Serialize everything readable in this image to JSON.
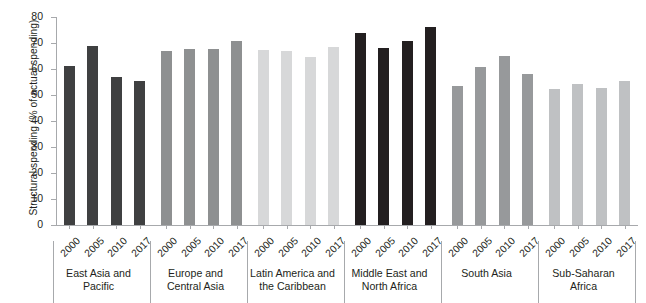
{
  "chart_data": {
    "type": "bar",
    "title": "",
    "xlabel": "",
    "ylabel": "Structural spending (% of actual spending)",
    "ylim": [
      0,
      80
    ],
    "ytick_labels": [
      "80",
      "70",
      "60",
      "50",
      "40",
      "30",
      "20",
      "10",
      "0"
    ],
    "ytick_values": [
      80,
      70,
      60,
      50,
      40,
      30,
      20,
      10,
      0
    ],
    "grid": false,
    "legend": "none",
    "categories": [
      "2000",
      "2005",
      "2010",
      "2017"
    ],
    "groups": [
      {
        "name": "East Asia and Pacific",
        "label_lines": [
          "East Asia and",
          "Pacific"
        ],
        "color": "#3f4041",
        "years": [
          "2000",
          "2005",
          "2010",
          "2017"
        ],
        "values": [
          61.0,
          69.0,
          56.9,
          55.3
        ]
      },
      {
        "name": "Europe and Central Asia",
        "label_lines": [
          "Europe and",
          "Central Asia"
        ],
        "color": "#8e9091",
        "years": [
          "2000",
          "2005",
          "2010",
          "2017"
        ],
        "values": [
          67.1,
          67.7,
          67.8,
          70.8
        ]
      },
      {
        "name": "Latin America and the Caribbean",
        "label_lines": [
          "Latin America and",
          "the Caribbean"
        ],
        "color": "#d7d8d9",
        "years": [
          "2000",
          "2005",
          "2010",
          "2017"
        ],
        "values": [
          67.4,
          66.9,
          64.5,
          68.3
        ]
      },
      {
        "name": "Middle East and North Africa",
        "label_lines": [
          "Middle East and",
          "North Africa"
        ],
        "color": "#231f20",
        "years": [
          "2000",
          "2005",
          "2010",
          "2017"
        ],
        "values": [
          74.0,
          68.1,
          70.6,
          76.2
        ]
      },
      {
        "name": "South Asia",
        "label_lines": [
          "South Asia"
        ],
        "color": "#97999b",
        "years": [
          "2000",
          "2005",
          "2010",
          "2017"
        ],
        "values": [
          53.4,
          60.7,
          64.9,
          58.2
        ]
      },
      {
        "name": "Sub-Saharan Africa",
        "label_lines": [
          "Sub-Saharan",
          "Africa"
        ],
        "color": "#bfc1c3",
        "years": [
          "2000",
          "2005",
          "2010",
          "2017"
        ],
        "values": [
          52.5,
          54.3,
          52.7,
          55.5
        ]
      }
    ]
  },
  "axis": {
    "y_title": "Structural spending (% of actual spending)"
  },
  "colors": {
    "axis": "#a7a9ac",
    "text": "#231f20",
    "background": "#ffffff"
  }
}
